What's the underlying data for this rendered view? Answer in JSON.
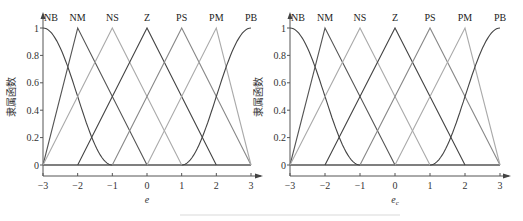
{
  "chart_data": [
    {
      "type": "line",
      "title": "",
      "xlabel": "e",
      "ylabel": "隶属函数",
      "xlim": [
        -3,
        3
      ],
      "ylim": [
        0,
        1
      ],
      "xticks": [
        "-3",
        "-2",
        "-1",
        "0",
        "1",
        "2",
        "3"
      ],
      "yticks": [
        "0",
        "0.2",
        "0.4",
        "0.6",
        "0.8",
        "1"
      ],
      "grid": false,
      "legend": "labels above peaks",
      "series": [
        {
          "name": "NB",
          "shape": "z-curve",
          "points": [
            [
              -3,
              1
            ],
            [
              -1,
              0
            ]
          ],
          "color": "#444444"
        },
        {
          "name": "NM",
          "shape": "triangle",
          "points": [
            [
              -3,
              0
            ],
            [
              -2,
              1
            ],
            [
              0,
              0
            ]
          ],
          "color": "#555555"
        },
        {
          "name": "NS",
          "shape": "triangle",
          "points": [
            [
              -3,
              0
            ],
            [
              -1,
              1
            ],
            [
              1,
              0
            ]
          ],
          "color": "#aaaaaa"
        },
        {
          "name": "Z",
          "shape": "triangle",
          "points": [
            [
              -2,
              0
            ],
            [
              0,
              1
            ],
            [
              2,
              0
            ]
          ],
          "color": "#444444"
        },
        {
          "name": "PS",
          "shape": "triangle",
          "points": [
            [
              -1,
              0
            ],
            [
              1,
              1
            ],
            [
              3,
              0
            ]
          ],
          "color": "#888888"
        },
        {
          "name": "PM",
          "shape": "triangle",
          "points": [
            [
              0,
              0
            ],
            [
              2,
              1
            ],
            [
              3,
              0
            ]
          ],
          "color": "#aaaaaa"
        },
        {
          "name": "PB",
          "shape": "s-curve",
          "points": [
            [
              1,
              0
            ],
            [
              3,
              1
            ]
          ],
          "color": "#444444"
        }
      ]
    },
    {
      "type": "line",
      "title": "",
      "xlabel": "e_c",
      "ylabel": "隶属函数",
      "xlim": [
        -3,
        3
      ],
      "ylim": [
        0,
        1
      ],
      "xticks": [
        "-3",
        "-2",
        "-1",
        "0",
        "1",
        "2",
        "3"
      ],
      "yticks": [
        "0",
        "0.2",
        "0.4",
        "0.6",
        "0.8",
        "1"
      ],
      "grid": false,
      "legend": "labels above peaks",
      "series": [
        {
          "name": "NB",
          "shape": "z-curve",
          "points": [
            [
              -3,
              1
            ],
            [
              -1,
              0
            ]
          ],
          "color": "#444444"
        },
        {
          "name": "NM",
          "shape": "triangle",
          "points": [
            [
              -3,
              0
            ],
            [
              -2,
              1
            ],
            [
              0,
              0
            ]
          ],
          "color": "#555555"
        },
        {
          "name": "NS",
          "shape": "triangle",
          "points": [
            [
              -3,
              0
            ],
            [
              -1,
              1
            ],
            [
              1,
              0
            ]
          ],
          "color": "#aaaaaa"
        },
        {
          "name": "Z",
          "shape": "triangle",
          "points": [
            [
              -2,
              0
            ],
            [
              0,
              1
            ],
            [
              2,
              0
            ]
          ],
          "color": "#444444"
        },
        {
          "name": "PS",
          "shape": "triangle",
          "points": [
            [
              -1,
              0
            ],
            [
              1,
              1
            ],
            [
              3,
              0
            ]
          ],
          "color": "#888888"
        },
        {
          "name": "PM",
          "shape": "triangle",
          "points": [
            [
              0,
              0
            ],
            [
              2,
              1
            ],
            [
              3,
              0
            ]
          ],
          "color": "#aaaaaa"
        },
        {
          "name": "PB",
          "shape": "s-curve",
          "points": [
            [
              1,
              0
            ],
            [
              3,
              1
            ]
          ],
          "color": "#444444"
        }
      ]
    }
  ]
}
